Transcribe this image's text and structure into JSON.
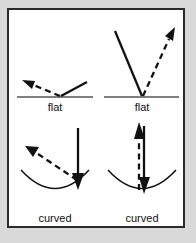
{
  "figure": {
    "background_color": "#d9d9d9",
    "panel_color": "#ffffff",
    "border_color": "#2b2b2b",
    "ink_color": "#111111",
    "surface_flat_color": "#555555",
    "panels": [
      {
        "id": "top-left",
        "label": "flat",
        "surface": "flat",
        "incoming_ray": {
          "style": "solid",
          "direction": "down-left-to-impact"
        },
        "outgoing_ray": {
          "style": "dashed",
          "direction": "up-left",
          "arrowhead": "up-left"
        }
      },
      {
        "id": "top-right",
        "label": "flat",
        "surface": "flat",
        "incoming_ray": {
          "style": "solid",
          "direction": "down-right-to-impact"
        },
        "outgoing_ray": {
          "style": "dashed",
          "direction": "up-right",
          "arrowhead": "up-right"
        }
      },
      {
        "id": "bottom-left",
        "label": "curved",
        "surface": "curved",
        "incoming_ray": {
          "style": "solid",
          "direction": "straight-down",
          "arrowhead": "down"
        },
        "outgoing_ray": {
          "style": "dashed",
          "direction": "up-left",
          "arrowhead": "up-left"
        }
      },
      {
        "id": "bottom-right",
        "label": "curved",
        "surface": "curved",
        "incoming_ray": {
          "style": "solid",
          "direction": "straight-down",
          "arrowhead": "down"
        },
        "outgoing_ray": {
          "style": "dashed",
          "direction": "straight-up",
          "arrowhead": "up"
        }
      }
    ]
  }
}
